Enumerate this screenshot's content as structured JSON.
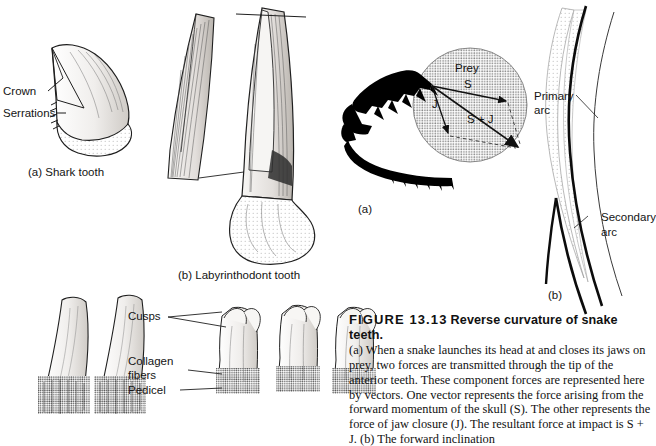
{
  "figure": {
    "number": "FIGURE 13.13",
    "title": "Reverse curvature of snake teeth.",
    "body": "(a) When a snake launches its head at and closes its jaws on prey, two forces are transmitted through the tip of the anterior teeth. These component forces are represented here by vectors. One vector represents the force arising from the forward momentum of the skull (S). The other represents the force of jaw closure (J). The resultant force at impact is S + J. (b) The forward inclination"
  },
  "panels": {
    "shark": {
      "caption": "(a) Shark tooth",
      "labels": {
        "crown": "Crown",
        "serrations": "Serrations"
      }
    },
    "labyrinthodont": {
      "caption": "(b) Labyrinthodont tooth"
    },
    "amphibian_teeth": {
      "labels": {
        "cusps": "Cusps",
        "collagen": "Collagen",
        "fibers": "fibers",
        "pedicel": "Pedicel"
      }
    },
    "snake_skull": {
      "caption": "(a)",
      "vectors": {
        "prey": "Prey",
        "s": "S",
        "j": "J",
        "sum": "S + J"
      }
    },
    "arcs": {
      "caption": "(b)",
      "labels": {
        "primary": "Primary",
        "primary2": "arc",
        "secondary": "Secondary",
        "secondary2": "arc"
      }
    }
  },
  "colors": {
    "ink": "#141414",
    "stipple": "#9a9a9a",
    "light_fill": "#f2f0ee",
    "mid_fill": "#d9d6d2",
    "dark": "#000000"
  }
}
